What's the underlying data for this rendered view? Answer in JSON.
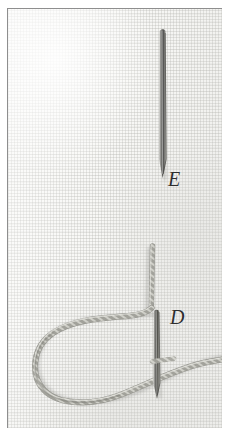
{
  "figure": {
    "kind": "halftone-photograph",
    "plate_background": "#f8f8f6",
    "border_color": "#8e8e8e"
  },
  "labels": [
    {
      "id": "E",
      "text": "E",
      "x": 160,
      "y": 160,
      "meaning": "label-for-upper-needle"
    },
    {
      "id": "D",
      "text": "D",
      "x": 162,
      "y": 298,
      "meaning": "label-for-lower-needle"
    }
  ],
  "objects": {
    "upper_needle": {
      "name": "upper-needle",
      "top": 30,
      "bottom": 176,
      "x": 160,
      "color": "#6b6b69"
    },
    "lower_needle": {
      "name": "lower-needle",
      "top": 310,
      "bottom": 392,
      "x": 155,
      "color": "#6b6b69"
    },
    "thread": {
      "name": "twisted-thread",
      "color": "#9b9b95",
      "highlight": "#d8d8d2",
      "description": "vertical strand descending to a corner, then a large open loop sweeping left and a tail running off the right edge"
    }
  },
  "colors": {
    "fabric": "#f8f8f6",
    "weave": "#a8a8a3",
    "thread": "#9b9b95",
    "needle": "#6b6b69",
    "ink": "#2e2e2e",
    "border": "#8e8e8e"
  }
}
